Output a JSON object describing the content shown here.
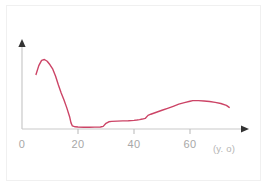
{
  "page": {
    "background_color": "#ffffff",
    "frame_color": "#f0f0f0"
  },
  "chart_data": {
    "type": "line",
    "title": "",
    "subtitle": "",
    "xlabel": "(y. o)",
    "ylabel": "",
    "xlim": [
      0,
      76
    ],
    "ylim": [
      0,
      1
    ],
    "grid": false,
    "legend": null,
    "axis_color": "#c9c9c9",
    "arrow_color": "#333333",
    "tick_color": "#bdbdbd",
    "tick_label_color": "#a8a8a8",
    "xticks": [
      0,
      20,
      40,
      60
    ],
    "xtick_labels": [
      "0",
      "20",
      "40",
      "60"
    ],
    "yticks": [],
    "ytick_labels": [],
    "series": [
      {
        "name": "curve",
        "color": "#cc4466",
        "line_width": 1.4,
        "x": [
          5,
          6,
          7,
          8,
          9,
          10,
          11,
          12,
          13,
          14,
          15,
          16,
          17,
          17.5,
          18,
          19,
          20,
          22,
          24,
          26,
          28,
          29,
          30,
          31,
          32,
          34,
          36,
          38,
          40,
          41,
          42,
          43,
          44,
          45,
          46,
          48,
          50,
          52,
          54,
          56,
          58,
          60,
          61,
          63,
          65,
          67,
          69,
          71,
          73,
          74
        ],
        "y": [
          0.62,
          0.72,
          0.78,
          0.79,
          0.77,
          0.73,
          0.68,
          0.6,
          0.5,
          0.41,
          0.33,
          0.24,
          0.14,
          0.07,
          0.035,
          0.025,
          0.022,
          0.02,
          0.02,
          0.021,
          0.023,
          0.03,
          0.065,
          0.082,
          0.087,
          0.09,
          0.092,
          0.094,
          0.098,
          0.102,
          0.107,
          0.113,
          0.12,
          0.155,
          0.168,
          0.19,
          0.213,
          0.235,
          0.258,
          0.282,
          0.3,
          0.315,
          0.322,
          0.322,
          0.318,
          0.312,
          0.302,
          0.29,
          0.268,
          0.245
        ]
      }
    ],
    "axis_unit_label": "(y. o)"
  },
  "plot_geometry": {
    "origin_x": 22,
    "origin_y": 129,
    "x_axis_end": 248,
    "y_axis_top": 42,
    "px_per_unit_x": 2.8,
    "y_full_px": 88
  }
}
